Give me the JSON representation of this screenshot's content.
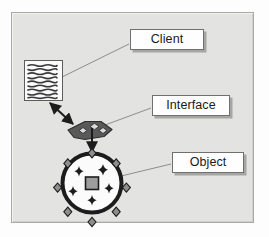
{
  "diagram": {
    "title_present": false,
    "labels": [
      {
        "id": "client",
        "text": "Client"
      },
      {
        "id": "interface",
        "text": "Interface"
      },
      {
        "id": "object",
        "text": "Object"
      }
    ],
    "shapes": {
      "client_document": {
        "name": "document-icon",
        "line_count": 9,
        "description": "page with wavy text lines"
      },
      "interface_connector": {
        "name": "interface-chevron",
        "diamond_count": 3
      },
      "object_circle": {
        "name": "object-ring",
        "nub_count": 8,
        "sparkle_count": 5,
        "center_shape": "square"
      }
    },
    "connectors": [
      {
        "id": "client-leader",
        "from": "client-label",
        "to": "document-icon",
        "arrow": "none"
      },
      {
        "id": "interface-leader",
        "from": "interface-label",
        "to": "interface-chevron",
        "arrow": "none"
      },
      {
        "id": "object-leader",
        "from": "object-label",
        "to": "object-ring",
        "arrow": "none"
      },
      {
        "id": "doc-to-interface",
        "from": "document-icon",
        "to": "interface-chevron",
        "arrow": "double"
      },
      {
        "id": "interface-to-object",
        "from": "interface-chevron",
        "to": "object-ring",
        "arrow": "single"
      }
    ],
    "colors": {
      "panel_background": "#e3e3e1",
      "panel_border": "#a9a9a7",
      "page_background": "#fdfdfd",
      "label_fill": "#fefefe",
      "label_border": "#707070",
      "label_text": "#1a1a1a",
      "leader_line": "#8d8d8b",
      "dark_shape": "#4a4a4a",
      "ink": "#1c1c1c",
      "mid_gray": "#9a9a9a"
    }
  }
}
